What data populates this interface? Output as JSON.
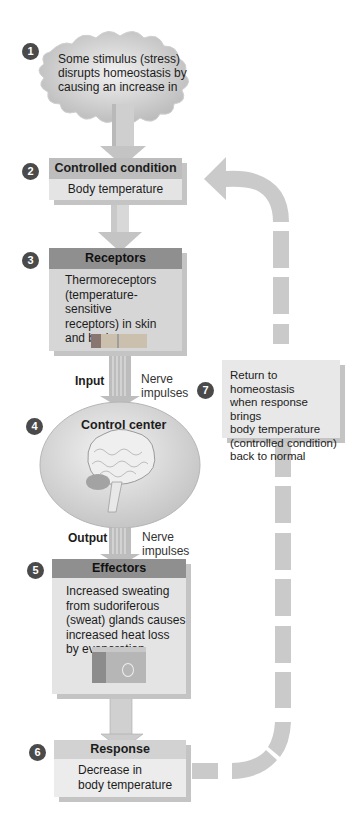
{
  "diagram": {
    "colors": {
      "arrow": "#c9c9c9",
      "box_fill": "#e4e4e4",
      "header_light": "#bdbdbd",
      "header_dark": "#8f8f8f",
      "step_badge": "#4a4a4a"
    },
    "steps": [
      {
        "number": "1",
        "header": "",
        "text": "Some stimulus (stress) disrupts homeostasis by causing an increase in",
        "lines": [
          "Some stimulus (stress)",
          "disrupts homeostasis by",
          "causing an increase in"
        ]
      },
      {
        "number": "2",
        "header": "Controlled condition",
        "text": "Body temperature"
      },
      {
        "number": "3",
        "header": "Receptors",
        "lines": [
          "Thermoreceptors",
          "(temperature-sensitive",
          "receptors) in skin",
          "and brain"
        ]
      },
      {
        "number": "4",
        "header": "Control center"
      },
      {
        "number": "5",
        "header": "Effectors",
        "lines": [
          "Increased sweating",
          "from sudoriferous",
          "(sweat) glands causes",
          "increased heat loss",
          "by evaporation"
        ]
      },
      {
        "number": "6",
        "header": "Response",
        "lines": [
          "Decrease in",
          "body temperature"
        ]
      },
      {
        "number": "7",
        "header": "",
        "lines": [
          "Return to homeostasis",
          "when response brings",
          "body temperature",
          "(controlled condition)",
          "back to normal"
        ]
      }
    ],
    "input_label": "Input",
    "output_label": "Output",
    "nerve_impulses_1": [
      "Nerve",
      "impulses"
    ],
    "nerve_impulses_2": [
      "Nerve",
      "impulses"
    ]
  }
}
